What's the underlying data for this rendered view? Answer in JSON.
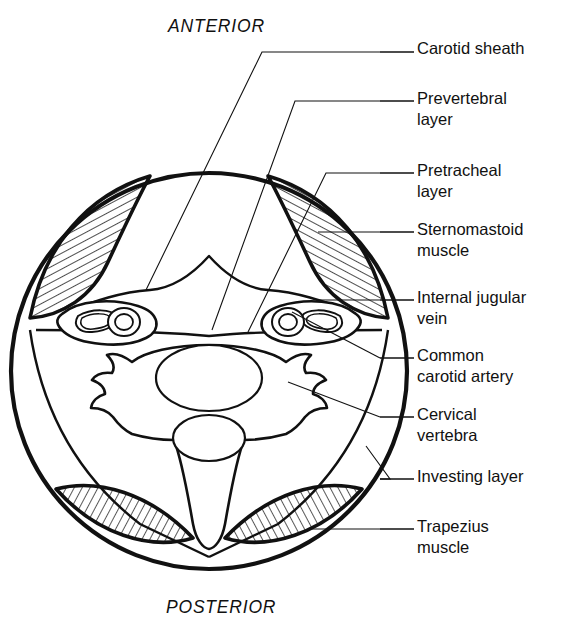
{
  "figure": {
    "orientation": {
      "top_label": "ANTERIOR",
      "bottom_label": "POSTERIOR"
    },
    "line_color": "#111111",
    "background_color": "#ffffff",
    "hatch_color": "#111111"
  },
  "callouts": [
    {
      "id": "carotid-sheath",
      "label": "Carotid sheath",
      "text_x": 417,
      "text_y": 38,
      "dash_x1": 380,
      "dash_x2": 414,
      "dash_y": 52,
      "leader": "380,52 262,52 146,290"
    },
    {
      "id": "prevertebral-layer",
      "label": "Prevertebral\nlayer",
      "text_x": 417,
      "text_y": 88,
      "dash_x1": 380,
      "dash_x2": 414,
      "dash_y": 101,
      "leader": "380,101 295,101 212,330"
    },
    {
      "id": "pretracheal-layer",
      "label": "Pretracheal\nlayer",
      "text_x": 417,
      "text_y": 160,
      "dash_x1": 380,
      "dash_x2": 414,
      "dash_y": 173,
      "leader": "380,173 326,173 246,333"
    },
    {
      "id": "sternomastoid-muscle",
      "label": "Sternomastoid\nmuscle",
      "text_x": 417,
      "text_y": 219,
      "dash_x1": 380,
      "dash_x2": 414,
      "dash_y": 232,
      "leader": "380,232 316,232"
    },
    {
      "id": "internal-jugular-vein",
      "label": "Internal jugular\nvein",
      "text_x": 417,
      "text_y": 287,
      "dash_x1": 380,
      "dash_x2": 414,
      "dash_y": 300,
      "leader": "380,300 315,300"
    },
    {
      "id": "common-carotid-artery",
      "label": "Common\ncarotid artery",
      "text_x": 417,
      "text_y": 345,
      "dash_x1": 380,
      "dash_x2": 414,
      "dash_y": 358,
      "leader": "380,358 292,312"
    },
    {
      "id": "cervical-vertebra",
      "label": "Cervical\nvertebra",
      "text_x": 417,
      "text_y": 404,
      "dash_x1": 380,
      "dash_x2": 414,
      "dash_y": 417,
      "leader": "380,417 292,380"
    },
    {
      "id": "investing-layer",
      "label": "Investing layer",
      "text_x": 417,
      "text_y": 466,
      "dash_x1": 380,
      "dash_x2": 414,
      "dash_y": 479,
      "leader": "380,479 388,479 365,447"
    },
    {
      "id": "trapezius-muscle",
      "label": "Trapezius\nmuscle",
      "text_x": 417,
      "text_y": 516,
      "dash_x1": 380,
      "dash_x2": 414,
      "dash_y": 529,
      "leader": "380,529 316,529"
    }
  ],
  "structures": {
    "outer_circle": {
      "name": "investing-layer-outline",
      "cx": 209,
      "cy": 371,
      "r": 198
    },
    "sternomastoid_left": "hatched crescent upper-left",
    "sternomastoid_right": "hatched crescent upper-right",
    "trapezius_left": "hatched lens lower-left",
    "trapezius_right": "hatched lens lower-right",
    "carotid_sheath_left": "oval containing jugular vein and carotid artery",
    "carotid_sheath_right": "oval containing jugular vein and carotid artery",
    "vertebra": "cervical vertebra with body, canal, transverse and spinous processes"
  }
}
